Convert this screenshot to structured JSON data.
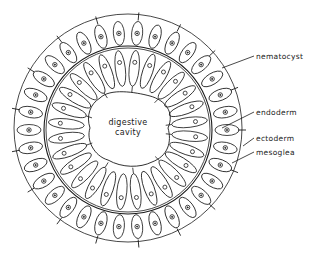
{
  "diagram": {
    "center_label": [
      "digestive",
      "cavity"
    ],
    "labels": [
      {
        "id": "nematocyst",
        "text": "nematocyst",
        "x": 256,
        "y": 56,
        "target": [
          222,
          68
        ]
      },
      {
        "id": "endoderm",
        "text": "endoderm",
        "x": 256,
        "y": 112,
        "target": [
          222,
          128
        ]
      },
      {
        "id": "ectoderm",
        "text": "ectoderm",
        "x": 256,
        "y": 138,
        "target": [
          243,
          146
        ]
      },
      {
        "id": "mesoglea",
        "text": "mesoglea",
        "x": 256,
        "y": 152,
        "target": [
          232,
          163
        ]
      }
    ],
    "colors": {
      "line": "#1a1a1a",
      "background": "#ffffff"
    }
  }
}
